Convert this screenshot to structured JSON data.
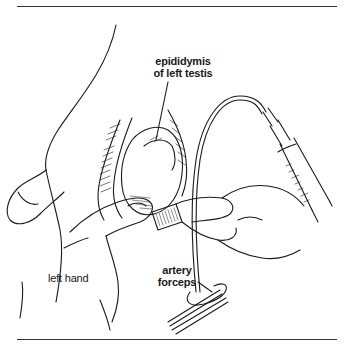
{
  "figure": {
    "labels": {
      "epididymis_line1": "epididymis",
      "epididymis_line2": "of left testis",
      "left_hand": "left hand",
      "forceps_line1": "artery",
      "forceps_line2": "forceps"
    },
    "colors": {
      "ink": "#1a1a1a",
      "background": "#ffffff",
      "rule": "#333333"
    }
  }
}
